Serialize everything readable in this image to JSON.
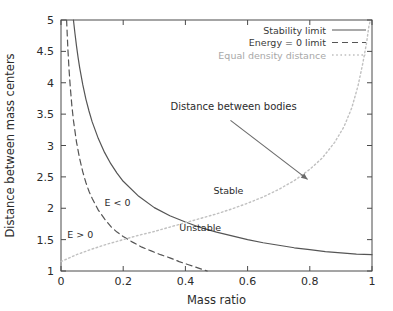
{
  "chart_data": {
    "type": "line",
    "title": "",
    "xlabel": "Mass ratio",
    "ylabel": "Distance between mass centers",
    "xlim": [
      0,
      1
    ],
    "ylim": [
      1,
      5
    ],
    "xticks": [
      "0",
      "0.2",
      "0.4",
      "0.6",
      "0.8",
      "1"
    ],
    "xtick_values": [
      0,
      0.2,
      0.4,
      0.6,
      0.8,
      1
    ],
    "yticks": [
      "1",
      "1.5",
      "2",
      "2.5",
      "3",
      "3.5",
      "4",
      "4.5",
      "5"
    ],
    "ytick_values": [
      1,
      1.5,
      2,
      2.5,
      3,
      3.5,
      4,
      4.5,
      5
    ],
    "grid": false,
    "legend_position": "top-right",
    "series": [
      {
        "name": "Stability limit",
        "style": "solid",
        "color": "#555555",
        "points": [
          [
            0.04,
            5.0
          ],
          [
            0.045,
            4.78
          ],
          [
            0.05,
            4.58
          ],
          [
            0.055,
            4.4
          ],
          [
            0.06,
            4.24
          ],
          [
            0.07,
            3.97
          ],
          [
            0.08,
            3.74
          ],
          [
            0.09,
            3.55
          ],
          [
            0.1,
            3.38
          ],
          [
            0.12,
            3.11
          ],
          [
            0.14,
            2.89
          ],
          [
            0.16,
            2.71
          ],
          [
            0.18,
            2.56
          ],
          [
            0.2,
            2.43
          ],
          [
            0.25,
            2.19
          ],
          [
            0.3,
            2.01
          ],
          [
            0.35,
            1.88
          ],
          [
            0.4,
            1.78
          ],
          [
            0.45,
            1.69
          ],
          [
            0.5,
            1.62
          ],
          [
            0.55,
            1.56
          ],
          [
            0.6,
            1.5
          ],
          [
            0.65,
            1.45
          ],
          [
            0.7,
            1.41
          ],
          [
            0.75,
            1.37
          ],
          [
            0.8,
            1.34
          ],
          [
            0.85,
            1.31
          ],
          [
            0.9,
            1.29
          ],
          [
            0.95,
            1.27
          ],
          [
            1.0,
            1.26
          ]
        ]
      },
      {
        "name": "Energy = 0 limit",
        "style": "dashed",
        "color": "#555555",
        "points": [
          [
            0.018,
            5.0
          ],
          [
            0.022,
            4.55
          ],
          [
            0.026,
            4.2
          ],
          [
            0.03,
            3.92
          ],
          [
            0.035,
            3.63
          ],
          [
            0.04,
            3.4
          ],
          [
            0.05,
            3.05
          ],
          [
            0.06,
            2.79
          ],
          [
            0.07,
            2.58
          ],
          [
            0.08,
            2.41
          ],
          [
            0.09,
            2.27
          ],
          [
            0.1,
            2.16
          ],
          [
            0.12,
            1.97
          ],
          [
            0.14,
            1.83
          ],
          [
            0.16,
            1.71
          ],
          [
            0.18,
            1.62
          ],
          [
            0.2,
            1.55
          ],
          [
            0.23,
            1.46
          ],
          [
            0.26,
            1.38
          ],
          [
            0.29,
            1.32
          ],
          [
            0.32,
            1.26
          ],
          [
            0.35,
            1.21
          ],
          [
            0.38,
            1.15
          ],
          [
            0.41,
            1.1
          ],
          [
            0.44,
            1.05
          ],
          [
            0.47,
            1.0
          ]
        ]
      },
      {
        "name": "Equal density distance",
        "style": "dotted",
        "color": "#c0c0c0",
        "points": [
          [
            0.0,
            1.15
          ],
          [
            0.05,
            1.26
          ],
          [
            0.1,
            1.35
          ],
          [
            0.15,
            1.43
          ],
          [
            0.2,
            1.5
          ],
          [
            0.25,
            1.57
          ],
          [
            0.3,
            1.63
          ],
          [
            0.35,
            1.7
          ],
          [
            0.4,
            1.77
          ],
          [
            0.45,
            1.84
          ],
          [
            0.5,
            1.91
          ],
          [
            0.55,
            1.99
          ],
          [
            0.6,
            2.08
          ],
          [
            0.65,
            2.18
          ],
          [
            0.7,
            2.3
          ],
          [
            0.75,
            2.44
          ],
          [
            0.8,
            2.62
          ],
          [
            0.84,
            2.8
          ],
          [
            0.88,
            3.05
          ],
          [
            0.91,
            3.3
          ],
          [
            0.935,
            3.6
          ],
          [
            0.955,
            3.95
          ],
          [
            0.97,
            4.3
          ],
          [
            0.982,
            4.62
          ],
          [
            0.99,
            4.9
          ],
          [
            0.995,
            5.0
          ]
        ]
      }
    ],
    "annotations": [
      {
        "text": "Stable",
        "x": 0.49,
        "y": 2.23
      },
      {
        "text": "Unstable",
        "x": 0.38,
        "y": 1.64
      },
      {
        "text": "E < 0",
        "x": 0.14,
        "y": 2.03
      },
      {
        "text": "E > 0",
        "x": 0.02,
        "y": 1.52
      }
    ],
    "callout": {
      "text": "Distance between bodies",
      "text_x": 0.555,
      "text_y": 3.56,
      "arrow_from_x": 0.545,
      "arrow_from_y": 3.4,
      "arrow_to_x": 0.793,
      "arrow_to_y": 2.46
    }
  },
  "axes": {
    "xlabel": "Mass ratio",
    "ylabel": "Distance between mass centers"
  },
  "legend": {
    "entries": [
      {
        "label": "Stability limit",
        "style": "solid"
      },
      {
        "label": "Energy = 0 limit",
        "style": "dashed"
      },
      {
        "label": "Equal density distance",
        "style": "dotted"
      }
    ]
  },
  "colors": {
    "solid": "#555555",
    "dashed": "#555555",
    "dotted": "#c0c0c0",
    "axis": "#4a4a4a",
    "text": "#2b2b2b",
    "muted_text": "#a8a8a8",
    "background": "#ffffff"
  }
}
